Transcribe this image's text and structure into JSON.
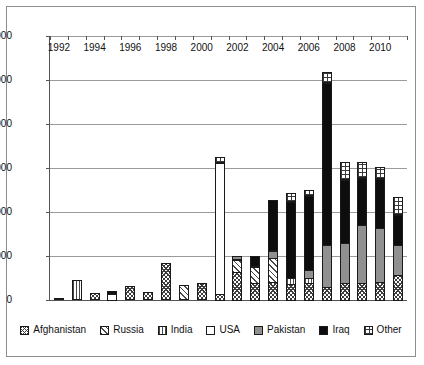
{
  "chart_data": {
    "type": "bar",
    "stacked": true,
    "title": "",
    "xlabel": "",
    "ylabel": "",
    "ylim": [
      0,
      6000
    ],
    "ytick_labels": [
      "0",
      "1000",
      "2000",
      "3000",
      "4000",
      "5000",
      "6000"
    ],
    "yticks": [
      0,
      1000,
      2000,
      3000,
      4000,
      5000,
      6000
    ],
    "grid": true,
    "legend_position": "bottom",
    "categories": [
      "1992",
      "1993",
      "1994",
      "1995",
      "1996",
      "1997",
      "1998",
      "1999",
      "2000",
      "2001",
      "2002",
      "2003",
      "2004",
      "2005",
      "2006",
      "2007",
      "2008",
      "2009",
      "2010",
      "2011"
    ],
    "visible_xtick_labels": [
      "1992",
      "1994",
      "1996",
      "1998",
      "2000",
      "2002",
      "2004",
      "2006",
      "2008",
      "2010"
    ],
    "series": [
      {
        "name": "Afghanistan",
        "pattern": "crosshatch",
        "values": [
          50,
          0,
          150,
          0,
          310,
          190,
          830,
          0,
          390,
          150,
          650,
          400,
          430,
          390,
          400,
          310,
          400,
          400,
          430,
          600
        ]
      },
      {
        "name": "Russia",
        "pattern": "diagonal",
        "values": [
          0,
          0,
          0,
          0,
          0,
          0,
          0,
          350,
          0,
          0,
          300,
          400,
          560,
          0,
          0,
          0,
          0,
          0,
          0,
          0
        ]
      },
      {
        "name": "India",
        "pattern": "vertical-lines",
        "values": [
          0,
          450,
          0,
          0,
          0,
          0,
          0,
          0,
          0,
          0,
          0,
          0,
          0,
          160,
          150,
          0,
          0,
          0,
          0,
          0
        ]
      },
      {
        "name": "USA",
        "pattern": "solid-white",
        "values": [
          0,
          0,
          0,
          170,
          0,
          0,
          0,
          0,
          0,
          3000,
          0,
          0,
          0,
          0,
          0,
          0,
          0,
          0,
          0,
          0
        ]
      },
      {
        "name": "Pakistan",
        "pattern": "solid-gray",
        "values": [
          0,
          0,
          0,
          0,
          0,
          0,
          0,
          0,
          0,
          0,
          100,
          0,
          200,
          0,
          200,
          980,
          950,
          1350,
          1250,
          700
        ]
      },
      {
        "name": "Iraq",
        "pattern": "solid-black",
        "values": [
          0,
          0,
          0,
          60,
          0,
          0,
          0,
          0,
          0,
          0,
          0,
          250,
          1160,
          1750,
          1700,
          3700,
          1450,
          1100,
          1150,
          700
        ]
      },
      {
        "name": "Other",
        "pattern": "checkered",
        "values": [
          0,
          0,
          0,
          0,
          0,
          0,
          0,
          0,
          0,
          150,
          0,
          0,
          0,
          200,
          150,
          260,
          400,
          350,
          270,
          400
        ]
      }
    ],
    "totals": [
      50,
      450,
      150,
      230,
      310,
      190,
      830,
      350,
      390,
      3300,
      1050,
      1050,
      2350,
      2500,
      2600,
      5250,
      3200,
      3200,
      3100,
      2400
    ]
  },
  "legend": {
    "items": [
      {
        "label": "Afghanistan",
        "pattern": "crosshatch"
      },
      {
        "label": "Russia",
        "pattern": "diagonal"
      },
      {
        "label": "India",
        "pattern": "vertical-lines"
      },
      {
        "label": "USA",
        "pattern": "solid-white"
      },
      {
        "label": "Pakistan",
        "pattern": "solid-gray"
      },
      {
        "label": "Iraq",
        "pattern": "solid-black"
      },
      {
        "label": "Other",
        "pattern": "checkered"
      }
    ]
  },
  "colors": {
    "iraq": "#0d0d0d",
    "pakistan": "#909090",
    "usa": "#ffffff",
    "grid": "#9a9a9a",
    "axis": "#555555",
    "border": "#8d8d8d",
    "text": "#111111"
  }
}
